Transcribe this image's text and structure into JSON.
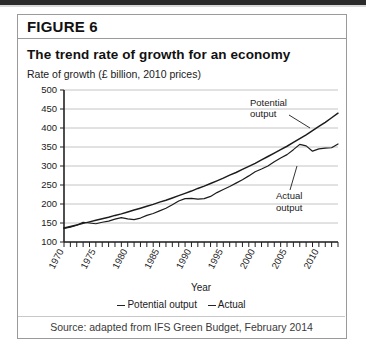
{
  "figure": {
    "label": "FIGURE 6",
    "title": "The trend rate of growth for an economy",
    "axis_caption": "Rate of growth (£ billion, 2010 prices)",
    "source": "Source: adapted from IFS Green Budget, February 2014"
  },
  "legend": {
    "items": [
      {
        "label": "Potential output",
        "color": "#222222"
      },
      {
        "label": "Actual",
        "color": "#222222"
      }
    ]
  },
  "annotations": [
    {
      "name": "potential-output-annotation",
      "line1": "Potential",
      "line2": "output"
    },
    {
      "name": "actual-output-annotation",
      "line1": "Actual",
      "line2": "output"
    }
  ],
  "chart_data": {
    "type": "line",
    "title": "The trend rate of growth for an economy",
    "subtitle": "Rate of growth (£ billion, 2010 prices)",
    "xlabel": "Year",
    "ylabel": "Rate of growth (£ billion, 2010 prices)",
    "xlim": [
      1970,
      2013
    ],
    "ylim": [
      100,
      500
    ],
    "yticks": [
      100,
      150,
      200,
      250,
      300,
      350,
      400,
      450,
      500
    ],
    "xticks": [
      1970,
      1975,
      1980,
      1985,
      1990,
      1995,
      2000,
      2005,
      2010
    ],
    "xtick_interval_minor": 1,
    "grid": true,
    "grid_axis": "y",
    "legend_position": "below",
    "x": [
      1970,
      1971,
      1972,
      1973,
      1974,
      1975,
      1976,
      1977,
      1978,
      1979,
      1980,
      1981,
      1982,
      1983,
      1984,
      1985,
      1986,
      1987,
      1988,
      1989,
      1990,
      1991,
      1992,
      1993,
      1994,
      1995,
      1996,
      1997,
      1998,
      1999,
      2000,
      2001,
      2002,
      2003,
      2004,
      2005,
      2006,
      2007,
      2008,
      2009,
      2010,
      2011,
      2012,
      2013
    ],
    "series": [
      {
        "name": "Potential output",
        "values": [
          137,
          141,
          145,
          149,
          153,
          157,
          161,
          165,
          170,
          174,
          179,
          184,
          189,
          194,
          199,
          205,
          210,
          216,
          222,
          228,
          234,
          241,
          247,
          254,
          261,
          268,
          276,
          283,
          291,
          299,
          307,
          316,
          325,
          334,
          343,
          352,
          362,
          372,
          382,
          393,
          404,
          415,
          427,
          439
        ]
      },
      {
        "name": "Actual",
        "values": [
          136,
          139,
          144,
          152,
          150,
          148,
          152,
          155,
          160,
          164,
          161,
          159,
          163,
          170,
          175,
          182,
          189,
          198,
          208,
          214,
          215,
          213,
          214,
          220,
          230,
          238,
          246,
          255,
          264,
          274,
          285,
          292,
          300,
          311,
          321,
          330,
          343,
          357,
          353,
          339,
          345,
          347,
          348,
          358
        ]
      }
    ],
    "notes": [
      "Actual output tracks close to potential output until 2008",
      "Actual output falls below potential after the 2008-09 recession and does not recover"
    ]
  }
}
